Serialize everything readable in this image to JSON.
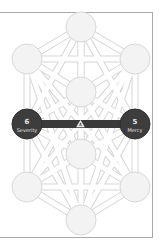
{
  "diagram": {
    "colors": {
      "frame": "#a8a8a8",
      "path_outline": "#d6d6d6",
      "node_light": "#f3f3f3",
      "node_dark": "#3d3d3d",
      "highlight_bar": "#3a3a3a",
      "label_text": "#e9e9e9"
    },
    "nodes": [
      {
        "id": "top",
        "cx": 81,
        "cy": 27,
        "highlighted": false
      },
      {
        "id": "upper-left",
        "cx": 27,
        "cy": 59,
        "highlighted": false
      },
      {
        "id": "upper-right",
        "cx": 135,
        "cy": 59,
        "highlighted": false
      },
      {
        "id": "center-upper",
        "cx": 81,
        "cy": 92,
        "highlighted": false
      },
      {
        "id": "middle-left",
        "cx": 27,
        "cy": 124,
        "highlighted": true,
        "number": "6",
        "label": "Severity"
      },
      {
        "id": "middle-right",
        "cx": 135,
        "cy": 124,
        "highlighted": true,
        "number": "5",
        "label": "Mercy"
      },
      {
        "id": "center-lower",
        "cx": 81,
        "cy": 154,
        "highlighted": false
      },
      {
        "id": "lower-left",
        "cx": 27,
        "cy": 187,
        "highlighted": false
      },
      {
        "id": "lower-right",
        "cx": 135,
        "cy": 187,
        "highlighted": false
      },
      {
        "id": "bottom",
        "cx": 81,
        "cy": 220,
        "highlighted": false
      }
    ],
    "highlighted_path": {
      "from": "middle-left",
      "to": "middle-right",
      "marker": "triangle-icon"
    },
    "left_node": {
      "number": "6",
      "label": "Severity"
    },
    "right_node": {
      "number": "5",
      "label": "Mercy"
    }
  }
}
